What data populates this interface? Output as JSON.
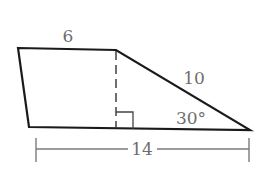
{
  "diagram": {
    "shape": "trapezoid",
    "labels": {
      "top_side": "6",
      "slant_side": "10",
      "angle": "30°",
      "base_dimension": "14"
    },
    "colors": {
      "outline": "#1a1a1a",
      "label": "#6e6e6e",
      "dimension_line": "#7a7a7a"
    }
  }
}
